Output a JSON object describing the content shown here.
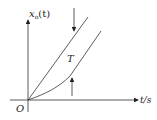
{
  "diagram": {
    "type": "ramp-response",
    "y_axis_label": "x",
    "y_axis_sub": "o",
    "y_axis_arg": "(t)",
    "x_axis_label": "t/s",
    "origin_label": "O",
    "lag_label": "T",
    "curves": [
      {
        "name": "ramp-input",
        "description": "straight line through origin"
      },
      {
        "name": "output-response",
        "description": "curve starting tangent to t-axis, asymptotically parallel to ramp, lagging by T"
      }
    ],
    "colors": {
      "stroke": "#333333",
      "background": "#ffffff"
    }
  }
}
